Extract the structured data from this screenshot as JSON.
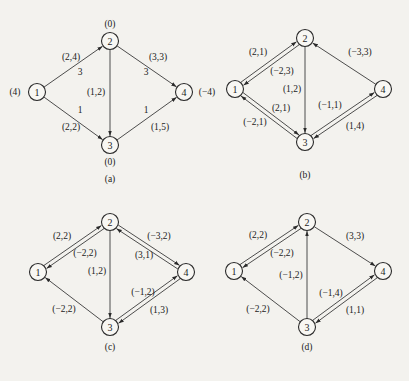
{
  "figure": {
    "panels": [
      {
        "id": "a",
        "caption": "(a)",
        "nodes": [
          {
            "id": "1",
            "label": "1",
            "x": 37,
            "y": 92,
            "supply": "(4)",
            "supply_pos": "left"
          },
          {
            "id": "2",
            "label": "2",
            "x": 110,
            "y": 41,
            "supply": "(0)",
            "supply_pos": "top"
          },
          {
            "id": "3",
            "label": "3",
            "x": 110,
            "y": 145,
            "supply": "(0)",
            "supply_pos": "bottom"
          },
          {
            "id": "4",
            "label": "4",
            "x": 184,
            "y": 92,
            "supply": "(−4)",
            "supply_pos": "right"
          }
        ],
        "edges": [
          {
            "from": "1",
            "to": "2",
            "label": "(2,4)",
            "flow": "3",
            "offset": 0
          },
          {
            "from": "1",
            "to": "3",
            "label": "(2,2)",
            "flow": "1",
            "offset": 0
          },
          {
            "from": "2",
            "to": "3",
            "label": "(1,2)",
            "flow": "",
            "offset": 0
          },
          {
            "from": "2",
            "to": "4",
            "label": "(3,3)",
            "flow": "3",
            "offset": 0
          },
          {
            "from": "3",
            "to": "4",
            "label": "(1,5)",
            "flow": "1",
            "offset": 0
          }
        ],
        "caption_pos": {
          "x": 110,
          "y": 179
        }
      },
      {
        "id": "b",
        "caption": "(b)",
        "nodes": [
          {
            "id": "1",
            "label": "1",
            "x": 235,
            "y": 89
          },
          {
            "id": "2",
            "label": "2",
            "x": 305,
            "y": 38
          },
          {
            "id": "3",
            "label": "3",
            "x": 305,
            "y": 142
          },
          {
            "id": "4",
            "label": "4",
            "x": 383,
            "y": 89
          }
        ],
        "edges": [
          {
            "from": "1",
            "to": "2",
            "label": "(2,1)",
            "offset": -2
          },
          {
            "from": "2",
            "to": "1",
            "label": "(−2,3)",
            "offset": -2
          },
          {
            "from": "1",
            "to": "3",
            "label": "(2,1)",
            "offset": -2
          },
          {
            "from": "3",
            "to": "1",
            "label": "(−2,1)",
            "offset": -2
          },
          {
            "from": "2",
            "to": "3",
            "label": "(1,2)",
            "offset": 0
          },
          {
            "from": "4",
            "to": "2",
            "label": "(−3,3)",
            "offset": 0
          },
          {
            "from": "3",
            "to": "4",
            "label": "(1,4)",
            "offset": -2
          },
          {
            "from": "4",
            "to": "3",
            "label": "(−1,1)",
            "offset": -2
          }
        ],
        "caption_pos": {
          "x": 305,
          "y": 175
        }
      },
      {
        "id": "c",
        "caption": "(c)",
        "nodes": [
          {
            "id": "1",
            "label": "1",
            "x": 38,
            "y": 272
          },
          {
            "id": "2",
            "label": "2",
            "x": 110,
            "y": 222
          },
          {
            "id": "3",
            "label": "3",
            "x": 110,
            "y": 327
          },
          {
            "id": "4",
            "label": "4",
            "x": 186,
            "y": 272
          }
        ],
        "edges": [
          {
            "from": "1",
            "to": "2",
            "label": "(2,2)",
            "offset": -2
          },
          {
            "from": "2",
            "to": "1",
            "label": "(−2,2)",
            "offset": -2
          },
          {
            "from": "2",
            "to": "3",
            "label": "(1,2)",
            "offset": 0
          },
          {
            "from": "3",
            "to": "1",
            "label": "(−2,2)",
            "offset": 0
          },
          {
            "from": "2",
            "to": "4",
            "label": "(3,1)",
            "offset": -2
          },
          {
            "from": "4",
            "to": "2",
            "label": "(−3,2)",
            "offset": -2
          },
          {
            "from": "3",
            "to": "4",
            "label": "(1,3)",
            "offset": -2
          },
          {
            "from": "4",
            "to": "3",
            "label": "(−1,2)",
            "offset": -2
          }
        ],
        "caption_pos": {
          "x": 110,
          "y": 347
        }
      },
      {
        "id": "d",
        "caption": "(d)",
        "nodes": [
          {
            "id": "1",
            "label": "1",
            "x": 234,
            "y": 271
          },
          {
            "id": "2",
            "label": "2",
            "x": 307,
            "y": 222
          },
          {
            "id": "3",
            "label": "3",
            "x": 307,
            "y": 327
          },
          {
            "id": "4",
            "label": "4",
            "x": 383,
            "y": 271
          }
        ],
        "edges": [
          {
            "from": "1",
            "to": "2",
            "label": "(2,2)",
            "offset": -2
          },
          {
            "from": "2",
            "to": "1",
            "label": "(−2,2)",
            "offset": -2
          },
          {
            "from": "3",
            "to": "2",
            "label": "(−1,2)",
            "offset": 0
          },
          {
            "from": "3",
            "to": "1",
            "label": "(−2,2)",
            "offset": 0
          },
          {
            "from": "2",
            "to": "4",
            "label": "(3,3)",
            "offset": 0
          },
          {
            "from": "3",
            "to": "4",
            "label": "(1,1)",
            "offset": -2
          },
          {
            "from": "4",
            "to": "3",
            "label": "(−1,4)",
            "offset": -2
          }
        ],
        "caption_pos": {
          "x": 307,
          "y": 347
        }
      }
    ],
    "label_positions": {
      "a": {
        "1-2": {
          "label": [
            71,
            57
          ],
          "flow": [
            80,
            72
          ]
        },
        "1-3": {
          "label": [
            71,
            127
          ],
          "flow": [
            80,
            110
          ]
        },
        "2-3": {
          "label": [
            96,
            92
          ]
        },
        "2-4": {
          "label": [
            158,
            57
          ],
          "flow": [
            146,
            72
          ]
        },
        "3-4": {
          "label": [
            160,
            127
          ],
          "flow": [
            146,
            110
          ]
        }
      },
      "b": {
        "1-2": {
          "label": [
            258,
            52
          ]
        },
        "2-1": {
          "label": [
            282,
            71
          ]
        },
        "1-3": {
          "label": [
            281,
            108
          ]
        },
        "3-1": {
          "label": [
            255,
            122
          ]
        },
        "2-3": {
          "label": [
            292,
            89
          ]
        },
        "4-2": {
          "label": [
            360,
            52
          ]
        },
        "3-4": {
          "label": [
            355,
            126
          ]
        },
        "4-3": {
          "label": [
            330,
            105
          ]
        }
      },
      "c": {
        "1-2": {
          "label": [
            62,
            236
          ]
        },
        "2-1": {
          "label": [
            85,
            253
          ]
        },
        "2-3": {
          "label": [
            97,
            271
          ]
        },
        "3-1": {
          "label": [
            64,
            309
          ]
        },
        "2-4": {
          "label": [
            144,
            255
          ]
        },
        "4-2": {
          "label": [
            159,
            236
          ]
        },
        "3-4": {
          "label": [
            159,
            310
          ]
        },
        "4-3": {
          "label": [
            143,
            292
          ]
        }
      },
      "d": {
        "1-2": {
          "label": [
            258,
            235
          ]
        },
        "2-1": {
          "label": [
            282,
            253
          ]
        },
        "3-2": {
          "label": [
            291,
            275
          ]
        },
        "3-1": {
          "label": [
            258,
            309
          ]
        },
        "2-4": {
          "label": [
            355,
            236
          ]
        },
        "3-4": {
          "label": [
            355,
            310
          ]
        },
        "4-3": {
          "label": [
            331,
            293
          ]
        }
      }
    }
  }
}
